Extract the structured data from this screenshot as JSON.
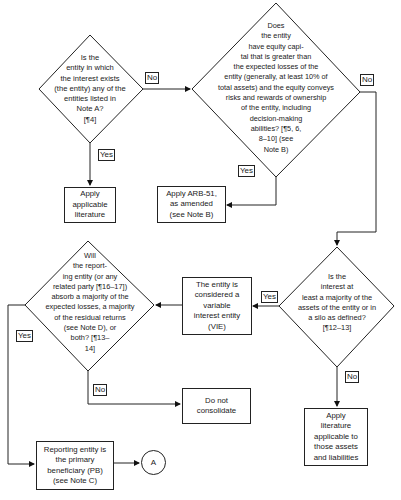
{
  "diagram": {
    "decisions": {
      "q1": {
        "text": "Is the\nentity in which\nthe interest exists\n(the entity) any of the\nentities listed in\nNote A?\n[¶4]"
      },
      "q2": {
        "text": "Does\nthe entity\nhave equity capi-\ntal that is greater than\nthe expected losses of the\nentity (generally, at least 10% of\ntotal assets) and the equity conveys\nrisks and rewards of ownership\nof the entity, including\ndecision-making\nabilities? [¶5, 6,\n8–10] (see\nNote B)"
      },
      "q3": {
        "text": "Is the\ninterest at\nleast a majority of the\nassets of the entity or in\na silo as defined?\n[¶12–13]"
      },
      "q4": {
        "text": "Will\nthe report-\ning entity (or any\nrelated party [¶16–17])\nabsorb a majority of the\nexpected losses, a majority\nof the residual returns\n(see Note D), or\nboth? [¶13–\n14]"
      }
    },
    "processes": {
      "apply_applicable": "Apply\napplicable\nliterature",
      "apply_arb51": "Apply ARB-51,\nas amended\n(see Note B)",
      "vie": "The entity is\nconsidered a\nvariable\ninterest entity\n(VIE)",
      "do_not_consolidate": "Do not\nconsolidate",
      "apply_literature_assets": "Apply\nliterature\napplicable to\nthose assets\nand liabilities",
      "primary_beneficiary": "Reporting entity is\nthe primary\nbeneficiary (PB)\n(see Note C)"
    },
    "connector": "A",
    "edge_labels": {
      "q1_no": "No",
      "q1_yes": "Yes",
      "q2_no": "No",
      "q2_yes": "Yes",
      "q3_yes": "Yes",
      "q3_no": "No",
      "q4_yes": "Yes",
      "q4_no": "No"
    }
  }
}
